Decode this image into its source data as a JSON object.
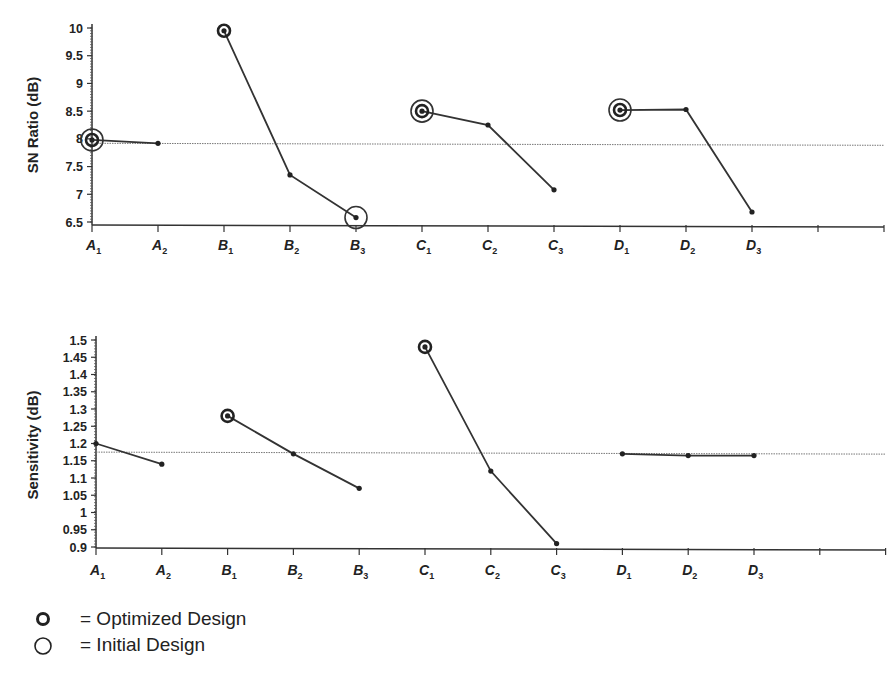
{
  "chart_data": [
    {
      "type": "line",
      "title": "",
      "ylabel": "SN Ratio (dB)",
      "xlabel": "",
      "ylim": [
        6.5,
        10
      ],
      "yticks": [
        "10",
        "9.5",
        "9",
        "8.5",
        "8",
        "7.5",
        "7",
        "6.5"
      ],
      "grand_mean": 7.92,
      "categories": [
        "A1",
        "A2",
        "B1",
        "B2",
        "B3",
        "C1",
        "C2",
        "C3",
        "D1",
        "D2",
        "D3"
      ],
      "series": [
        {
          "name": "A",
          "levels": [
            "A1",
            "A2"
          ],
          "values": [
            7.98,
            7.92
          ]
        },
        {
          "name": "B",
          "levels": [
            "B1",
            "B2",
            "B3"
          ],
          "values": [
            9.95,
            7.35,
            6.58
          ]
        },
        {
          "name": "C",
          "levels": [
            "C1",
            "C2",
            "C3"
          ],
          "values": [
            8.5,
            8.25,
            7.08
          ]
        },
        {
          "name": "D",
          "levels": [
            "D1",
            "D2",
            "D3"
          ],
          "values": [
            8.52,
            8.53,
            6.68
          ]
        }
      ],
      "optimized": [
        "A1",
        "B1",
        "C1",
        "D1"
      ],
      "initial": [
        "A1",
        "B3",
        "C1",
        "D1"
      ]
    },
    {
      "type": "line",
      "title": "",
      "ylabel": "Sensitivity (dB)",
      "xlabel": "",
      "ylim": [
        0.9,
        1.5
      ],
      "yticks": [
        "1.5",
        "1.45",
        "1.4",
        "1.35",
        "1.3",
        "1.25",
        "1.2",
        "1.15",
        "1.1",
        "1.05",
        "1",
        "0.95",
        "0.9"
      ],
      "grand_mean": 1.175,
      "categories": [
        "A1",
        "A2",
        "B1",
        "B2",
        "B3",
        "C1",
        "C2",
        "C3",
        "D1",
        "D2",
        "D3"
      ],
      "series": [
        {
          "name": "A",
          "levels": [
            "A1",
            "A2"
          ],
          "values": [
            1.2,
            1.14
          ]
        },
        {
          "name": "B",
          "levels": [
            "B1",
            "B2",
            "B3"
          ],
          "values": [
            1.28,
            1.17,
            1.07
          ]
        },
        {
          "name": "C",
          "levels": [
            "C1",
            "C2",
            "C3"
          ],
          "values": [
            1.48,
            1.12,
            0.91
          ]
        },
        {
          "name": "D",
          "levels": [
            "D1",
            "D2",
            "D3"
          ],
          "values": [
            1.17,
            1.165,
            1.165
          ]
        }
      ],
      "optimized": [
        "B1",
        "C1"
      ],
      "initial": []
    }
  ],
  "legend": {
    "optimized_label": "= Optimized Design",
    "initial_label": "= Initial Design"
  }
}
